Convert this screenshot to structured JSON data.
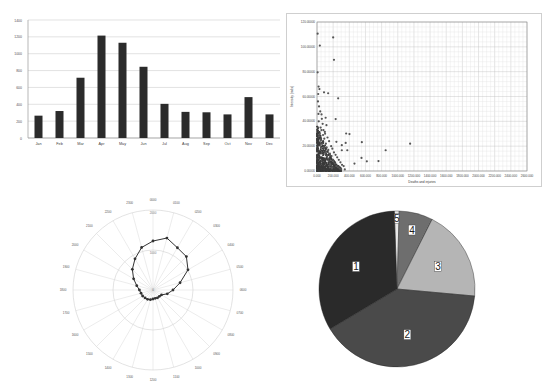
{
  "chart_data": [
    {
      "id": "bar",
      "type": "bar",
      "title": "",
      "xlabel": "",
      "ylabel": "",
      "categories": [
        "Jan",
        "Feb",
        "Mar",
        "Apr",
        "May",
        "Jun",
        "Jul",
        "Aug",
        "Sep",
        "Oct",
        "Nov",
        "Dec"
      ],
      "values": [
        265,
        320,
        715,
        1215,
        1130,
        845,
        405,
        310,
        305,
        280,
        485,
        280
      ],
      "ylim": [
        0,
        1400
      ],
      "yticks": [
        0,
        200,
        400,
        600,
        800,
        1000,
        1200,
        1400
      ],
      "grid": true,
      "bar_color": "#2b2b2b",
      "legend": "none"
    },
    {
      "id": "scatter",
      "type": "scatter",
      "title": "",
      "xlabel": "Deaths and injuries",
      "ylabel": "Intensity (rads)",
      "xlim": [
        0,
        2600
      ],
      "ylim": [
        0,
        120
      ],
      "xticks": [
        "0.000",
        "200.000",
        "400.000",
        "600.000",
        "800.000",
        "1000.000",
        "1200.000",
        "1400.000",
        "1600.000",
        "1800.000",
        "2000.000",
        "2200.000",
        "2400.000",
        "2600.000"
      ],
      "yticks": [
        "0.00000",
        "20.00000",
        "40.00000",
        "60.00000",
        "80.00000",
        "100.00000",
        "120.00000"
      ],
      "grid": true,
      "marker_color": "#555555",
      "points": [
        [
          8,
          110.6
        ],
        [
          35,
          101
        ],
        [
          200,
          107.6
        ],
        [
          210,
          89.5
        ],
        [
          8,
          79.5
        ],
        [
          262,
          58.5
        ],
        [
          138,
          62.6
        ],
        [
          87,
          63.4
        ],
        [
          231,
          41.8
        ],
        [
          361,
          30.2
        ],
        [
          402,
          29.7
        ],
        [
          555,
          23.2
        ],
        [
          1153,
          22
        ],
        [
          850,
          16.7
        ],
        [
          761,
          8
        ],
        [
          617,
          7.8
        ],
        [
          551,
          10.5
        ],
        [
          464,
          6
        ],
        [
          375,
          16.7
        ],
        [
          355,
          22.6
        ],
        [
          307,
          20.8
        ],
        [
          307,
          16.7
        ],
        [
          240,
          23.5
        ],
        [
          344,
          1.3
        ],
        [
          107,
          42.9
        ],
        [
          117,
          36.9
        ],
        [
          56,
          45.6
        ],
        [
          97,
          31.5
        ],
        [
          20,
          68
        ],
        [
          30,
          66
        ],
        [
          15,
          62
        ],
        [
          12,
          56
        ],
        [
          25,
          52
        ],
        [
          40,
          48
        ],
        [
          18,
          46
        ],
        [
          60,
          42
        ],
        [
          70,
          38
        ],
        [
          22,
          40
        ],
        [
          45,
          35
        ],
        [
          80,
          33
        ],
        [
          100,
          30
        ],
        [
          130,
          27
        ],
        [
          150,
          24
        ],
        [
          175,
          20
        ],
        [
          190,
          18
        ],
        [
          210,
          15
        ],
        [
          230,
          13
        ],
        [
          250,
          11
        ],
        [
          270,
          9
        ],
        [
          290,
          7
        ],
        [
          310,
          5
        ],
        [
          330,
          4
        ],
        [
          200,
          9
        ],
        [
          180,
          12
        ],
        [
          160,
          14
        ],
        [
          140,
          17
        ],
        [
          120,
          19
        ],
        [
          260,
          3
        ],
        [
          280,
          2
        ],
        [
          300,
          1.5
        ],
        [
          220,
          6
        ],
        [
          240,
          4
        ],
        [
          160,
          6
        ],
        [
          190,
          3
        ],
        [
          140,
          10
        ],
        [
          110,
          22
        ],
        [
          90,
          26
        ],
        [
          75,
          29
        ],
        [
          55,
          33
        ],
        [
          35,
          30
        ],
        [
          25,
          28
        ],
        [
          15,
          35
        ],
        [
          45,
          25
        ],
        [
          65,
          22
        ],
        [
          85,
          19
        ],
        [
          105,
          15
        ],
        [
          125,
          12
        ],
        [
          145,
          8
        ],
        [
          165,
          5
        ],
        [
          185,
          2
        ]
      ],
      "dense_cluster": {
        "x_range": [
          0,
          300
        ],
        "y_range": [
          0,
          35
        ]
      }
    },
    {
      "id": "polar",
      "type": "line",
      "subtype": "radar",
      "title": "",
      "categories": [
        "0000",
        "0100",
        "0200",
        "0300",
        "0400",
        "0500",
        "0600",
        "0700",
        "0800",
        "0900",
        "1000",
        "1100",
        "1200",
        "1300",
        "1400",
        "1500",
        "1600",
        "1700",
        "1800",
        "1900",
        "2000",
        "2100",
        "2200",
        "2300"
      ],
      "values": [
        1225,
        1345,
        1220,
        1180,
        1010,
        700,
        500,
        370,
        245,
        225,
        225,
        215,
        225,
        250,
        270,
        280,
        300,
        310,
        340,
        420,
        560,
        730,
        900,
        1100
      ],
      "rlim": [
        0,
        2000
      ],
      "rings": [
        1000,
        2000
      ],
      "center_label": "0",
      "line_color": "#333333",
      "grid": true
    },
    {
      "id": "pie",
      "type": "pie",
      "title": "",
      "labels": [
        "1",
        "2",
        "3",
        "4",
        "5"
      ],
      "values": [
        33,
        40,
        19,
        7,
        1
      ],
      "colors": [
        "#2a2a2a",
        "#4a4a4a",
        "#b5b5b5",
        "#6e6e6e",
        "#e8e8e8"
      ],
      "start_angle_deg": 0,
      "direction": "clockwise",
      "slice_order_from_top": [
        "5",
        "4",
        "3",
        "2",
        "1"
      ]
    }
  ]
}
